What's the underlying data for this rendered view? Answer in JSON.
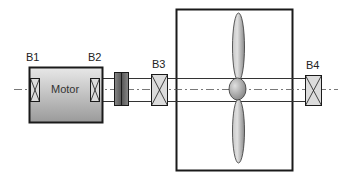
{
  "diagram": {
    "type": "mechanical-schematic",
    "labels": {
      "b1": "B1",
      "b2": "B2",
      "b3": "B3",
      "b4": "B4",
      "motor": "Motor"
    },
    "components": [
      {
        "id": "motor",
        "label": "Motor"
      },
      {
        "id": "bearing-b1",
        "label": "B1"
      },
      {
        "id": "bearing-b2",
        "label": "B2"
      },
      {
        "id": "coupling",
        "label": ""
      },
      {
        "id": "bearing-b3",
        "label": "B3"
      },
      {
        "id": "propeller-enclosure",
        "label": ""
      },
      {
        "id": "propeller",
        "label": ""
      },
      {
        "id": "bearing-b4",
        "label": "B4"
      }
    ],
    "colors": {
      "stroke": "#1a1a1a",
      "motor_fill_light": "#e6e6e6",
      "motor_fill_dark": "#9a9a9a",
      "bearing_fill": "#dcdcdc",
      "centerline": "#555555"
    }
  }
}
